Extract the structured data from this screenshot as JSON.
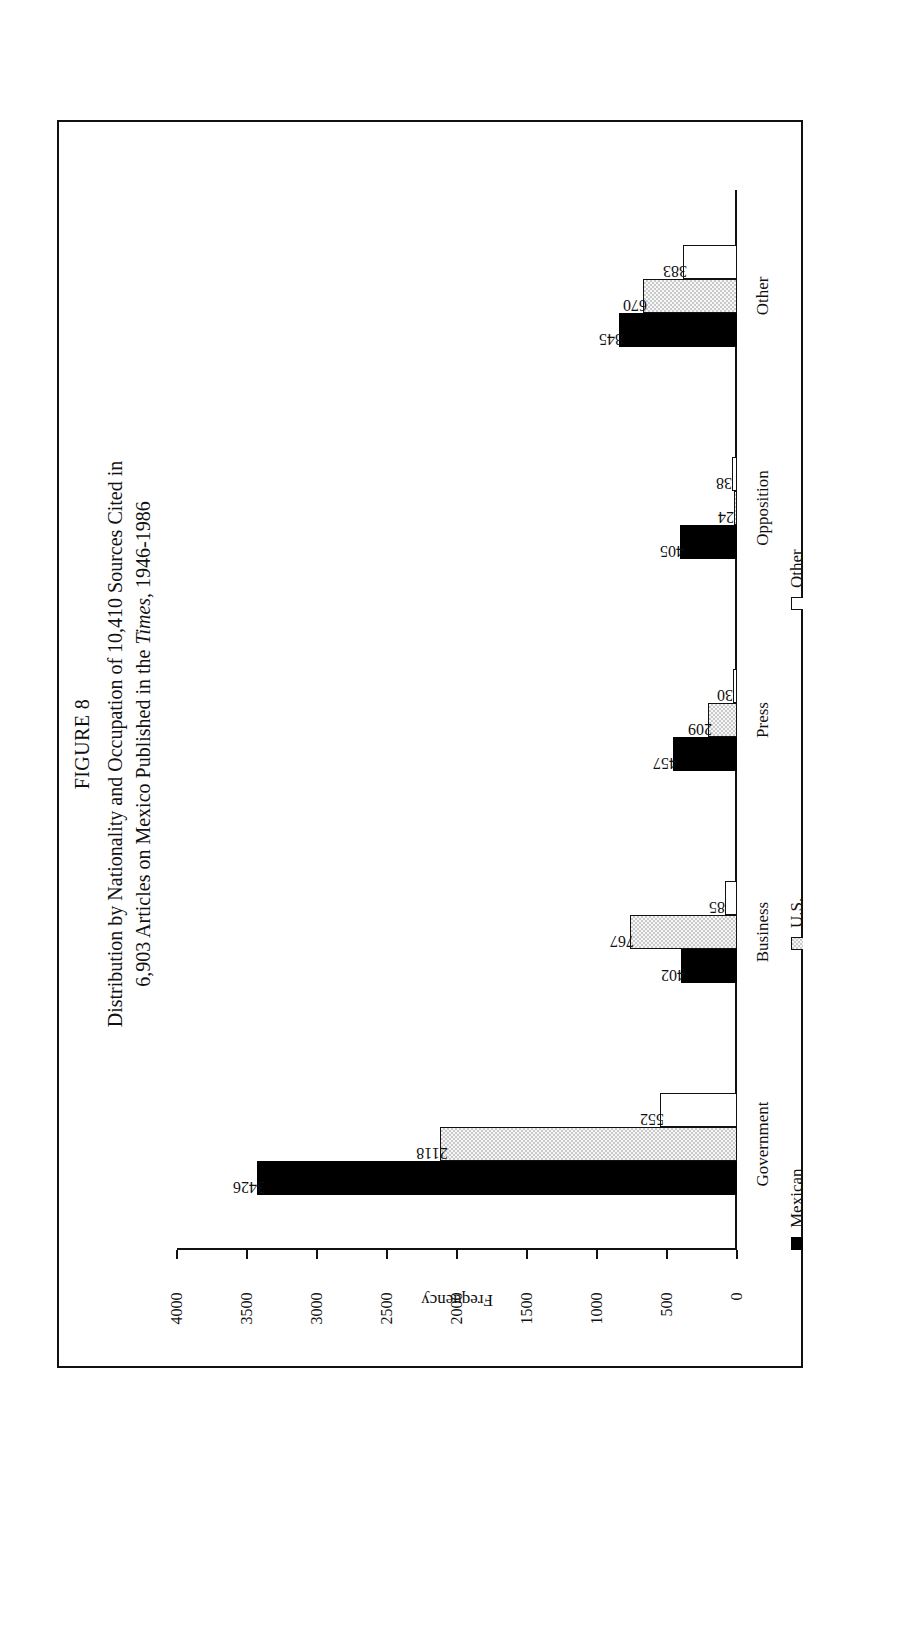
{
  "figure": {
    "number_label": "FIGURE 8",
    "title_line1": "Distribution by Nationality and Occupation of 10,410 Sources Cited in",
    "title_line2_pre": "6,903 Articles on Mexico Published in the ",
    "title_line2_italic": "Times",
    "title_line2_post": ", 1946-1986"
  },
  "chart_data": {
    "type": "bar",
    "orientation": "vertical",
    "title": "Distribution by Nationality and Occupation of 10,410 Sources Cited in 6,903 Articles on Mexico Published in the Times, 1946-1986",
    "xlabel": "",
    "ylabel": "Frequency",
    "ylim": [
      0,
      4000
    ],
    "yticks": [
      0,
      500,
      1000,
      1500,
      2000,
      2500,
      3000,
      3500,
      4000
    ],
    "ytick_labels": [
      "0",
      "500",
      "1000",
      "1500",
      "2000",
      "2500",
      "3000",
      "3500",
      "4000"
    ],
    "grid": false,
    "legend_position": "bottom-left",
    "categories": [
      "Government",
      "Business",
      "Press",
      "Opposition",
      "Other"
    ],
    "series": [
      {
        "name": "Mexican",
        "color": "#000000",
        "values": [
          3426,
          402,
          457,
          405,
          845
        ]
      },
      {
        "name": "U.S.",
        "color": "#c9c9c9",
        "values": [
          2118,
          767,
          209,
          24,
          670
        ]
      },
      {
        "name": "Other",
        "color": "#ffffff",
        "values": [
          552,
          85,
          30,
          38,
          383
        ]
      }
    ],
    "value_labels": [
      [
        "3426",
        "2118",
        "552"
      ],
      [
        "402",
        "767",
        "85"
      ],
      [
        "457",
        "209",
        "30"
      ],
      [
        "405",
        "24",
        "38"
      ],
      [
        "845",
        "670",
        "383"
      ]
    ]
  },
  "legend": {
    "items": [
      {
        "label": "Mexican",
        "swatch": "black-square-icon"
      },
      {
        "label": "U.S.",
        "swatch": "gray-hatched-square-icon"
      },
      {
        "label": "Other",
        "swatch": "white-outline-square-icon"
      }
    ]
  }
}
